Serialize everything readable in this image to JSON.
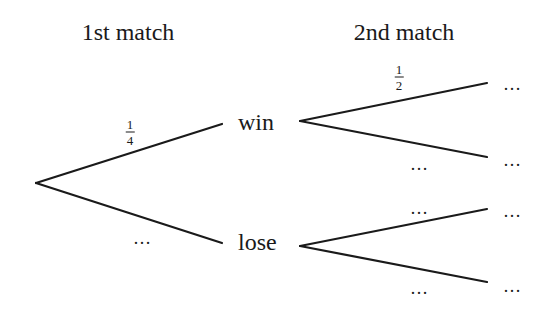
{
  "diagram": {
    "type": "probability-tree",
    "headers": {
      "first": "1st match",
      "second": "2nd match"
    },
    "nodes": {
      "win": "win",
      "lose": "lose"
    },
    "branches": {
      "root_to_win": {
        "numerator": "1",
        "denominator": "4"
      },
      "root_to_lose": "…",
      "win_to_win": {
        "numerator": "1",
        "denominator": "2"
      },
      "win_to_lose": "…",
      "lose_to_win": "…",
      "lose_to_lose": "…"
    },
    "outcomes": [
      "…",
      "…",
      "…",
      "…"
    ],
    "line_color": "#1a1a1a"
  }
}
